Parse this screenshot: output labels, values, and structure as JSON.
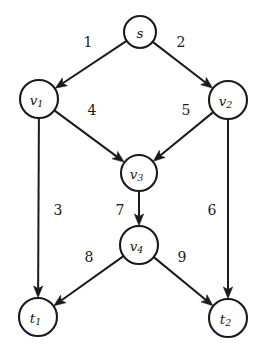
{
  "diagram": {
    "type": "directed-graph",
    "background_color": "#ffffff",
    "stroke_color": "#1a1a1a",
    "canvas": {
      "width": 265,
      "height": 360
    },
    "nodes": [
      {
        "id": "s",
        "label": "s",
        "sub": "",
        "cx": 140,
        "cy": 32,
        "r": 16
      },
      {
        "id": "v1",
        "label": "v",
        "sub": "1",
        "cx": 39,
        "cy": 99,
        "r": 19
      },
      {
        "id": "v2",
        "label": "v",
        "sub": "2",
        "cx": 228,
        "cy": 100,
        "r": 19
      },
      {
        "id": "v3",
        "label": "v",
        "sub": "3",
        "cx": 139,
        "cy": 173,
        "r": 18
      },
      {
        "id": "v4",
        "label": "v",
        "sub": "4",
        "cx": 139,
        "cy": 245,
        "r": 19
      },
      {
        "id": "t1",
        "label": "t",
        "sub": "1",
        "cx": 38,
        "cy": 317,
        "r": 19
      },
      {
        "id": "t2",
        "label": "t",
        "sub": "2",
        "cx": 228,
        "cy": 318,
        "r": 19
      }
    ],
    "edges": [
      {
        "id": "e1",
        "from": "s",
        "to": "v1",
        "label": "1",
        "label_x": 88,
        "label_y": 42
      },
      {
        "id": "e2",
        "from": "s",
        "to": "v2",
        "label": "2",
        "label_x": 181,
        "label_y": 42
      },
      {
        "id": "e3",
        "from": "v1",
        "to": "t1",
        "label": "3",
        "label_x": 58,
        "label_y": 210
      },
      {
        "id": "e4",
        "from": "v1",
        "to": "v3",
        "label": "4",
        "label_x": 92,
        "label_y": 110
      },
      {
        "id": "e5",
        "from": "v2",
        "to": "v3",
        "label": "5",
        "label_x": 186,
        "label_y": 110
      },
      {
        "id": "e6",
        "from": "v2",
        "to": "t2",
        "label": "6",
        "label_x": 212,
        "label_y": 210
      },
      {
        "id": "e7",
        "from": "v3",
        "to": "v4",
        "label": "7",
        "label_x": 120,
        "label_y": 210
      },
      {
        "id": "e8",
        "from": "v4",
        "to": "t1",
        "label": "8",
        "label_x": 89,
        "label_y": 257
      },
      {
        "id": "e9",
        "from": "v4",
        "to": "t2",
        "label": "9",
        "label_x": 182,
        "label_y": 257
      }
    ]
  }
}
